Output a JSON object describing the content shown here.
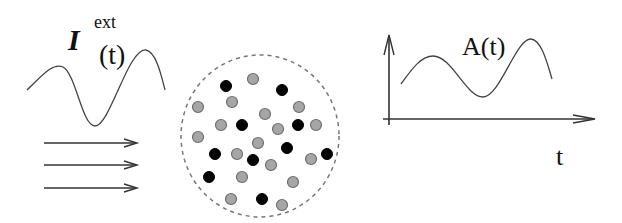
{
  "input_panel": {
    "symbol": "I",
    "superscript": "ext",
    "argument": "(t)",
    "signal": "oscillating-input-signal",
    "arrows": [
      "input-arrow",
      "input-arrow",
      "input-arrow"
    ]
  },
  "population": {
    "boundary": "dashed-circle",
    "neuron_colors": {
      "excitatory_or_active": "#050505",
      "other": "#a6a6a6"
    },
    "black_neurons": [
      [
        226,
        86
      ],
      [
        282,
        90
      ],
      [
        242,
        125
      ],
      [
        298,
        125
      ],
      [
        215,
        154
      ],
      [
        253,
        160
      ],
      [
        287,
        148
      ],
      [
        327,
        154
      ],
      [
        209,
        177
      ],
      [
        262,
        199
      ]
    ],
    "gray_neurons": [
      [
        253,
        79
      ],
      [
        232,
        102
      ],
      [
        198,
        107
      ],
      [
        299,
        107
      ],
      [
        221,
        125
      ],
      [
        265,
        114
      ],
      [
        316,
        125
      ],
      [
        278,
        129
      ],
      [
        198,
        137
      ],
      [
        258,
        143
      ],
      [
        237,
        154
      ],
      [
        311,
        159
      ],
      [
        271,
        165
      ],
      [
        242,
        177
      ],
      [
        293,
        182
      ],
      [
        231,
        199
      ],
      [
        282,
        205
      ]
    ]
  },
  "output_panel": {
    "label": "A(t)",
    "x_axis_label": "t",
    "signal": "population-activity-signal"
  }
}
